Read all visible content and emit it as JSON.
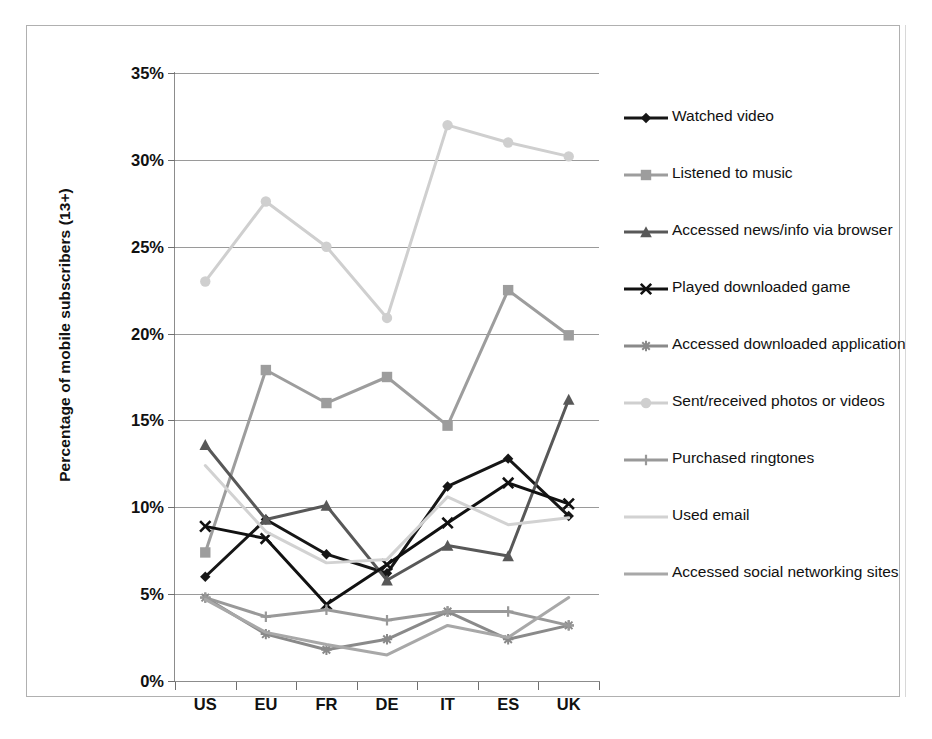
{
  "top_caption": "",
  "chart_data": {
    "type": "line",
    "title": "",
    "xlabel": "",
    "ylabel": "Percentage of mobile subscribers (13+)",
    "categories": [
      "US",
      "EU",
      "FR",
      "DE",
      "IT",
      "ES",
      "UK"
    ],
    "ylim": [
      0,
      35
    ],
    "ytick_values": [
      0,
      5,
      10,
      15,
      20,
      25,
      30,
      35
    ],
    "ytick_labels": [
      "0%",
      "5%",
      "10%",
      "15%",
      "20%",
      "25%",
      "30%",
      "35%"
    ],
    "grid": true,
    "legend_position": "right",
    "series": [
      {
        "name": "Watched video",
        "color": "#161616",
        "marker": "diamond",
        "values": [
          6.0,
          9.3,
          7.3,
          6.2,
          11.2,
          12.8,
          9.5
        ]
      },
      {
        "name": "Listened to music",
        "color": "#9d9d9d",
        "marker": "square",
        "values": [
          7.4,
          17.9,
          16.0,
          17.5,
          14.7,
          22.5,
          19.9
        ]
      },
      {
        "name": "Accessed news/info via browser",
        "color": "#585858",
        "marker": "triangle",
        "values": [
          13.6,
          9.3,
          10.1,
          5.8,
          7.8,
          7.2,
          16.2
        ]
      },
      {
        "name": "Played downloaded game",
        "color": "#111111",
        "marker": "cross",
        "values": [
          8.9,
          8.2,
          4.4,
          6.7,
          9.1,
          11.4,
          10.2
        ]
      },
      {
        "name": "Accessed downloaded application",
        "color": "#8a8a8a",
        "marker": "star",
        "values": [
          4.8,
          2.7,
          1.8,
          2.4,
          4.0,
          2.4,
          3.2
        ]
      },
      {
        "name": "Sent/received photos or videos",
        "color": "#cfcfcf",
        "marker": "circle",
        "values": [
          23.0,
          27.6,
          25.0,
          20.9,
          32.0,
          31.0,
          30.2
        ]
      },
      {
        "name": "Purchased ringtones",
        "color": "#999999",
        "marker": "plus",
        "values": [
          4.8,
          3.7,
          4.1,
          3.5,
          4.0,
          4.0,
          3.2
        ]
      },
      {
        "name": "Used email",
        "color": "#d2d2d2",
        "marker": "none",
        "values": [
          12.4,
          8.6,
          6.8,
          7.0,
          10.6,
          9.0,
          9.4
        ]
      },
      {
        "name": "Accessed social networking sites",
        "color": "#a8a8a8",
        "marker": "none",
        "values": [
          4.7,
          2.8,
          2.1,
          1.5,
          3.2,
          2.5,
          4.8
        ]
      }
    ]
  },
  "legend": {
    "items": [
      {
        "label": "Watched video"
      },
      {
        "label": "Listened to music"
      },
      {
        "label": "Accessed news/info via browser"
      },
      {
        "label": "Played downloaded game"
      },
      {
        "label": "Accessed downloaded application"
      },
      {
        "label": "Sent/received photos or videos"
      },
      {
        "label": "Purchased ringtones"
      },
      {
        "label": "Used email"
      },
      {
        "label": "Accessed social networking sites"
      }
    ]
  }
}
